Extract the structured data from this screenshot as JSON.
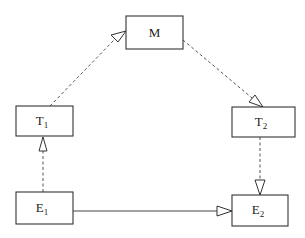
{
  "diagram": {
    "nodes": [
      {
        "id": "M",
        "label": "M",
        "sub": "",
        "x": 126,
        "y": 16,
        "w": 57,
        "h": 33
      },
      {
        "id": "T1",
        "label": "T",
        "sub": "1",
        "x": 16,
        "y": 106,
        "w": 57,
        "h": 30
      },
      {
        "id": "T2",
        "label": "T",
        "sub": "2",
        "x": 232,
        "y": 107,
        "w": 63,
        "h": 30
      },
      {
        "id": "E1",
        "label": "E",
        "sub": "1",
        "x": 16,
        "y": 192,
        "w": 57,
        "h": 32
      },
      {
        "id": "E2",
        "label": "E",
        "sub": "2",
        "x": 232,
        "y": 195,
        "w": 56,
        "h": 31
      }
    ],
    "edges": [
      {
        "from": "T1",
        "to": "M",
        "style": "dashed",
        "arrow": "open-triangle"
      },
      {
        "from": "M",
        "to": "T2",
        "style": "dashed",
        "arrow": "open-triangle"
      },
      {
        "from": "E1",
        "to": "T1",
        "style": "dashed",
        "arrow": "open-triangle"
      },
      {
        "from": "T2",
        "to": "E2",
        "style": "dashed",
        "arrow": "open-triangle"
      },
      {
        "from": "E1",
        "to": "E2",
        "style": "solid",
        "arrow": "open-triangle"
      }
    ]
  }
}
